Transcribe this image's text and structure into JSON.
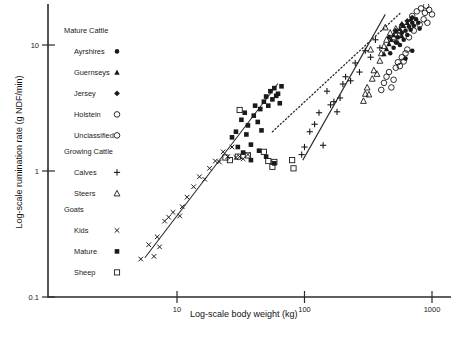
{
  "chart_data": {
    "type": "scatter",
    "title": "",
    "xlabel": "Log-scale body weight (kg)",
    "ylabel": "Log-scale rumination rate (g NDF/min)",
    "xscale": "log",
    "yscale": "log",
    "xlim": [
      4.0,
      1300
    ],
    "ylim": [
      0.1,
      22
    ],
    "xticks": [
      10,
      100,
      1000
    ],
    "xticklabels": [
      "10",
      "100",
      "1000"
    ],
    "yticks": [
      0.1,
      1,
      10
    ],
    "yticklabels": [
      "0.1",
      "1",
      "10"
    ],
    "grid": false,
    "legend_position": "upper-left-inside",
    "legend_groups": [
      {
        "heading": "Mature Cattle",
        "entries": [
          {
            "label": "Ayrshires",
            "marker": "filled-circle"
          },
          {
            "label": "Guernseys",
            "marker": "filled-triangle"
          },
          {
            "label": "Jersey",
            "marker": "filled-diamond"
          },
          {
            "label": "Holstein",
            "marker": "open-circle"
          },
          {
            "label": "Unclassified",
            "marker": "open-circle"
          }
        ]
      },
      {
        "heading": "Growing Cattle",
        "entries": [
          {
            "label": "Calves",
            "marker": "plus"
          },
          {
            "label": "Steers",
            "marker": "open-triangle"
          }
        ]
      },
      {
        "heading": "Goats",
        "entries": [
          {
            "label": "Kids",
            "marker": "cross"
          },
          {
            "label": "Mature",
            "marker": "filled-square"
          },
          {
            "label": "Sheep",
            "marker": "open-square"
          }
        ]
      }
    ],
    "series": [
      {
        "name": "Kids",
        "marker": "cross",
        "points": [
          [
            5.2,
            0.2
          ],
          [
            6.0,
            0.26
          ],
          [
            6.6,
            0.21
          ],
          [
            7.0,
            0.3
          ],
          [
            7.3,
            0.25
          ],
          [
            8.0,
            0.4
          ],
          [
            8.6,
            0.43
          ],
          [
            9.3,
            0.47
          ],
          [
            10.5,
            0.44
          ],
          [
            11.0,
            0.52
          ],
          [
            12.0,
            0.62
          ],
          [
            13.5,
            0.75
          ],
          [
            15.0,
            0.9
          ],
          [
            16.5,
            0.86
          ],
          [
            18.0,
            1.05
          ],
          [
            20.0,
            1.2
          ],
          [
            21.5,
            1.18
          ],
          [
            23.0,
            1.42
          ],
          [
            25.0,
            1.3
          ],
          [
            27.0,
            1.55
          ],
          [
            29.0,
            1.28
          ],
          [
            31.0,
            1.3
          ],
          [
            33.0,
            1.25
          ],
          [
            36.0,
            1.35
          ]
        ]
      },
      {
        "name": "Mature goats",
        "marker": "filled-square",
        "points": [
          [
            27.0,
            1.85
          ],
          [
            29.0,
            2.05
          ],
          [
            30.0,
            1.55
          ],
          [
            32.0,
            2.55
          ],
          [
            33.0,
            1.4
          ],
          [
            34.0,
            2.9
          ],
          [
            35.0,
            1.95
          ],
          [
            36.0,
            2.3
          ],
          [
            38.0,
            1.62
          ],
          [
            40.0,
            2.75
          ],
          [
            41.0,
            3.3
          ],
          [
            43.0,
            2.45
          ],
          [
            45.0,
            3.1
          ],
          [
            46.0,
            2.1
          ],
          [
            48.0,
            3.55
          ],
          [
            50.0,
            3.9
          ],
          [
            52.0,
            3.3
          ],
          [
            54.0,
            4.3
          ],
          [
            56.0,
            3.7
          ],
          [
            58.0,
            4.55
          ],
          [
            60.0,
            3.95
          ],
          [
            62.0,
            4.1
          ],
          [
            64.0,
            3.45
          ],
          [
            66.0,
            4.7
          ],
          [
            50.0,
            1.3
          ],
          [
            58.0,
            1.15
          ],
          [
            44.0,
            1.45
          ],
          [
            38.0,
            1.22
          ]
        ]
      },
      {
        "name": "Sheep",
        "marker": "open-square",
        "points": [
          [
            24.0,
            1.28
          ],
          [
            30.0,
            1.3
          ],
          [
            31.0,
            3.05
          ],
          [
            36.0,
            1.33
          ],
          [
            48.0,
            1.42
          ],
          [
            52.0,
            1.2
          ],
          [
            56.0,
            1.08
          ],
          [
            58.0,
            1.18
          ],
          [
            80.0,
            1.22
          ],
          [
            82.0,
            1.05
          ],
          [
            26.0,
            1.22
          ]
        ]
      },
      {
        "name": "Calves",
        "marker": "plus",
        "points": [
          [
            95.0,
            1.35
          ],
          [
            100.0,
            1.55
          ],
          [
            110.0,
            2.05
          ],
          [
            120.0,
            2.35
          ],
          [
            130.0,
            2.9
          ],
          [
            150.0,
            4.3
          ],
          [
            160.0,
            3.35
          ],
          [
            170.0,
            3.55
          ],
          [
            180.0,
            2.95
          ],
          [
            190.0,
            3.8
          ],
          [
            200.0,
            4.9
          ],
          [
            210.0,
            5.6
          ],
          [
            230.0,
            5.2
          ],
          [
            250.0,
            7.2
          ],
          [
            270.0,
            6.1
          ],
          [
            300.0,
            9.0
          ],
          [
            330.0,
            8.0
          ],
          [
            360.0,
            11.0
          ],
          [
            390.0,
            9.5
          ],
          [
            140.0,
            1.6
          ]
        ]
      },
      {
        "name": "Steers",
        "marker": "open-triangle",
        "points": [
          [
            290.0,
            3.6
          ],
          [
            300.0,
            4.1
          ],
          [
            310.0,
            4.6
          ],
          [
            320.0,
            4.05
          ],
          [
            340.0,
            5.4
          ],
          [
            350.0,
            6.3
          ],
          [
            370.0,
            5.9
          ],
          [
            390.0,
            7.5
          ],
          [
            400.0,
            8.6
          ],
          [
            420.0,
            9.8
          ],
          [
            440.0,
            11.0
          ],
          [
            470.0,
            12.5
          ],
          [
            500.0,
            11.5
          ],
          [
            520.0,
            13.5
          ],
          [
            550.0,
            12.0
          ],
          [
            580.0,
            14.5
          ],
          [
            430.0,
            13.8
          ],
          [
            330.0,
            9.2
          ]
        ]
      },
      {
        "name": "Ayrshires",
        "marker": "filled-circle",
        "points": [
          [
            470.0,
            8.6
          ],
          [
            500.0,
            9.5
          ],
          [
            520.0,
            10.5
          ],
          [
            540.0,
            11.5
          ],
          [
            560.0,
            10.0
          ],
          [
            580.0,
            12.5
          ],
          [
            600.0,
            11.0
          ],
          [
            620.0,
            13.0
          ],
          [
            640.0,
            12.0
          ],
          [
            660.0,
            14.0
          ],
          [
            680.0,
            13.2
          ],
          [
            700.0,
            15.0
          ],
          [
            720.0,
            14.2
          ],
          [
            750.0,
            16.0
          ],
          [
            780.0,
            15.0
          ],
          [
            800.0,
            13.5
          ],
          [
            620.0,
            7.8
          ],
          [
            700.0,
            9.0
          ]
        ]
      },
      {
        "name": "Guernseys",
        "marker": "filled-triangle",
        "points": [
          [
            440.0,
            9.3
          ],
          [
            460.0,
            10.2
          ],
          [
            480.0,
            11.0
          ],
          [
            500.0,
            12.0
          ],
          [
            520.0,
            12.8
          ],
          [
            560.0,
            13.5
          ],
          [
            600.0,
            14.2
          ],
          [
            640.0,
            15.0
          ],
          [
            680.0,
            16.0
          ],
          [
            420.0,
            8.5
          ],
          [
            540.0,
            10.5
          ],
          [
            580.0,
            11.8
          ]
        ]
      },
      {
        "name": "Jersey",
        "marker": "filled-diamond",
        "points": [
          [
            460.0,
            11.5
          ],
          [
            520.0,
            13.0
          ],
          [
            580.0,
            14.5
          ],
          [
            640.0,
            15.5
          ],
          [
            700.0,
            16.5
          ]
        ]
      },
      {
        "name": "Holstein",
        "marker": "open-circle",
        "points": [
          [
            420.0,
            5.0
          ],
          [
            440.0,
            5.6
          ],
          [
            460.0,
            6.1
          ],
          [
            480.0,
            4.6
          ],
          [
            500.0,
            5.3
          ],
          [
            520.0,
            6.6
          ],
          [
            540.0,
            7.3
          ],
          [
            560.0,
            6.8
          ],
          [
            580.0,
            8.0
          ],
          [
            600.0,
            7.4
          ],
          [
            620.0,
            8.6
          ],
          [
            400.0,
            4.4
          ],
          [
            640.0,
            9.2
          ]
        ]
      },
      {
        "name": "Unclassified",
        "marker": "open-circle",
        "points": [
          [
            700.0,
            17.0
          ],
          [
            760.0,
            18.5
          ],
          [
            820.0,
            19.5
          ],
          [
            880.0,
            18.0
          ],
          [
            900.0,
            20.5
          ],
          [
            950.0,
            19.0
          ],
          [
            720.0,
            13.0
          ],
          [
            800.0,
            14.5
          ],
          [
            860.0,
            16.0
          ],
          [
            1000.0,
            17.5
          ],
          [
            660.0,
            11.5
          ],
          [
            920.0,
            15.0
          ]
        ]
      }
    ],
    "fit_lines": [
      {
        "name": "goat-regression",
        "style": "solid",
        "x": [
          5.6,
          62.0
        ],
        "y": [
          0.205,
          4.95
        ]
      },
      {
        "name": "cattle-regression",
        "style": "solid",
        "x": [
          97.0,
          430.0
        ],
        "y": [
          1.22,
          17.5
        ]
      },
      {
        "name": "combined-regression",
        "style": "dotted",
        "x": [
          56.0,
          560.0
        ],
        "y": [
          2.05,
          17.8
        ]
      }
    ]
  }
}
